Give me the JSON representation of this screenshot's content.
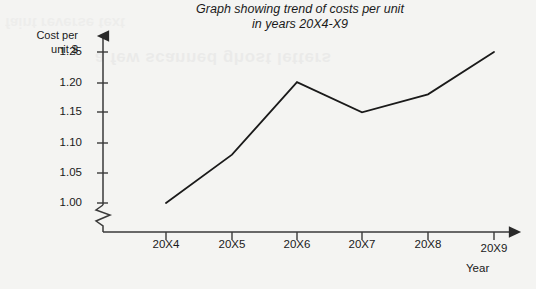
{
  "title": {
    "line1": "Graph showing trend of costs per unit",
    "line2": "in years 20X4-X9"
  },
  "y_axis": {
    "label_line1": "Cost per",
    "label_line2": "unit $",
    "ticks": [
      "1.25",
      "1.20",
      "1.15",
      "1.10",
      "1.05",
      "1.00"
    ],
    "break_marker": "axis-break-zigzag"
  },
  "x_axis": {
    "title": "Year",
    "ticks": [
      "20X4",
      "20X5",
      "20X6",
      "20X7",
      "20X8",
      "20X9"
    ]
  },
  "colors": {
    "line": "#1a1a1a",
    "axis": "#3a3a3a",
    "background": "#f4f4f2",
    "text": "#1a1a1a"
  },
  "chart_data": {
    "type": "line",
    "title": "Graph showing trend of costs per unit in years 20X4-X9",
    "xlabel": "Year",
    "ylabel": "Cost per unit $",
    "categories": [
      "20X4",
      "20X5",
      "20X6",
      "20X7",
      "20X8",
      "20X9"
    ],
    "values": [
      1.0,
      1.08,
      1.2,
      1.15,
      1.18,
      1.25
    ],
    "series": [
      {
        "name": "Cost per unit $",
        "values": [
          1.0,
          1.08,
          1.2,
          1.15,
          1.18,
          1.25
        ]
      }
    ],
    "ylim": [
      1.0,
      1.25
    ],
    "ytick_values": [
      1.0,
      1.05,
      1.1,
      1.15,
      1.2,
      1.25
    ],
    "y_axis_broken": true,
    "grid": false,
    "legend": "none",
    "markers": false,
    "axis_arrows": true
  }
}
